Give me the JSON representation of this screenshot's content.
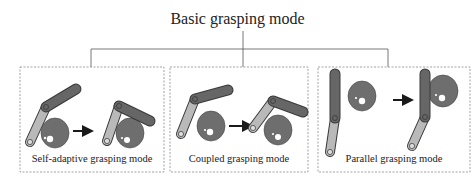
{
  "title": "Basic grasping mode",
  "modes": [
    {
      "label": "Self-adaptive grasping mode"
    },
    {
      "label": "Coupled grasping mode"
    },
    {
      "label": "Parallel grasping mode"
    }
  ],
  "colors": {
    "proximal_link": "#b9b9b9",
    "distal_link": "#666666",
    "object": "#6e6e6e",
    "outline": "#3a3a3a",
    "connector": "#555555",
    "dashed_border": "#8a8a8a",
    "arrow": "#1a1a1a"
  }
}
